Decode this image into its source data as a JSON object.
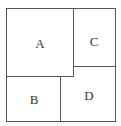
{
  "diagram": {
    "regions": [
      {
        "id": "A",
        "label": "A"
      },
      {
        "id": "B",
        "label": "B"
      },
      {
        "id": "C",
        "label": "C"
      },
      {
        "id": "D",
        "label": "D"
      }
    ],
    "line_color": "#555555"
  }
}
